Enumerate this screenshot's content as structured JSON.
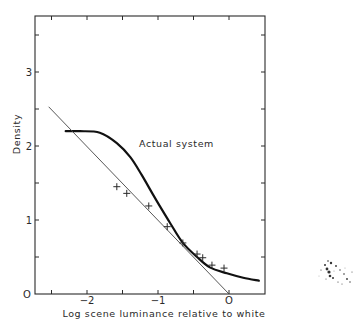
{
  "chart_data": {
    "type": "line",
    "title": "",
    "xlabel": "Log scene luminance relative to white",
    "ylabel": "Density",
    "xlim": [
      -2.72,
      0.51
    ],
    "ylim": [
      0,
      3.76
    ],
    "grid": false,
    "legend": null,
    "x_ticks": [
      -2.5,
      -2,
      -1.5,
      -1,
      -0.5,
      0
    ],
    "x_tick_labels": [
      {
        "value": -2,
        "label": "-2"
      },
      {
        "value": -1,
        "label": "-1"
      },
      {
        "value": 0,
        "label": "O"
      }
    ],
    "y_ticks": [
      0,
      0.5,
      1,
      1.5,
      2,
      2.5,
      3,
      3.5
    ],
    "y_tick_labels": [
      {
        "value": 0,
        "label": "O"
      },
      {
        "value": 1,
        "label": "1"
      },
      {
        "value": 2,
        "label": "2"
      },
      {
        "value": 3,
        "label": "3"
      }
    ],
    "annotations": [
      {
        "text": "Actual system",
        "x": -1.27,
        "y": 2.0
      }
    ],
    "series": [
      {
        "name": "Actual system",
        "style": "thick-line",
        "x": [
          -2.3,
          -2.1,
          -1.82,
          -1.58,
          -1.39,
          -1.23,
          -1.08,
          -0.97,
          -0.83,
          -0.65,
          -0.45,
          -0.27,
          -0.03,
          0.2,
          0.42
        ],
        "y": [
          2.2,
          2.2,
          2.18,
          2.04,
          1.85,
          1.61,
          1.36,
          1.18,
          0.96,
          0.69,
          0.5,
          0.36,
          0.28,
          0.22,
          0.18
        ]
      },
      {
        "name": "Ideal reproduction (slope -1)",
        "style": "thin-line",
        "x": [
          -2.54,
          0.0
        ],
        "y": [
          2.53,
          0.0
        ]
      },
      {
        "name": "Measured points",
        "style": "cross-markers",
        "x": [
          -1.58,
          -1.44,
          -1.13,
          -0.87,
          -0.65,
          -0.45,
          -0.37,
          -0.24,
          -0.07
        ],
        "y": [
          1.45,
          1.36,
          1.19,
          0.91,
          0.69,
          0.54,
          0.49,
          0.39,
          0.35
        ]
      }
    ]
  },
  "labels": {
    "xlabel": "Log scene luminance relative to white",
    "ylabel": "Density",
    "annotation": "Actual system"
  }
}
